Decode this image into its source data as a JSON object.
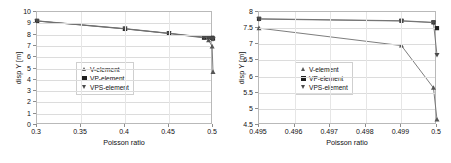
{
  "figure": {
    "panels": [
      {
        "id": "left",
        "chart_data": {
          "type": "line",
          "title": "",
          "xlabel": "Poisson ratio",
          "ylabel": "disp Y [m]",
          "xlim": [
            0.3,
            0.5
          ],
          "ylim": [
            0,
            10
          ],
          "xticks": [
            "0.3",
            "0.35",
            "0.4",
            "0.45",
            "0.5"
          ],
          "xtick_values": [
            0.3,
            0.35,
            0.4,
            0.45,
            0.5
          ],
          "yticks": [
            "0",
            "1",
            "2",
            "3",
            "4",
            "5",
            "6",
            "7",
            "8",
            "9",
            "10"
          ],
          "ytick_values": [
            0,
            1,
            2,
            3,
            4,
            5,
            6,
            7,
            8,
            9,
            10
          ],
          "grid": true,
          "legend_position": "center-left",
          "series": [
            {
              "name": "V-element",
              "marker": "triangle-up",
              "color": "#555555",
              "x": [
                0.3,
                0.4,
                0.45,
                0.49,
                0.495,
                0.499,
                0.5
              ],
              "values": [
                9.2,
                8.5,
                8.1,
                7.7,
                7.5,
                6.95,
                4.7
              ]
            },
            {
              "name": "VP-element",
              "marker": "square",
              "color": "#1f1f1f",
              "x": [
                0.3,
                0.4,
                0.45,
                0.49,
                0.495,
                0.499,
                0.5
              ],
              "values": [
                9.22,
                8.53,
                8.12,
                7.78,
                7.78,
                7.72,
                7.65
              ]
            },
            {
              "name": "VPS-element",
              "marker": "triangle-down",
              "color": "#4a4a4a",
              "x": [
                0.3,
                0.4,
                0.45,
                0.49,
                0.495,
                0.499,
                0.5
              ],
              "values": [
                9.2,
                8.51,
                8.1,
                7.75,
                7.7,
                7.68,
                7.6
              ]
            }
          ]
        }
      },
      {
        "id": "right",
        "chart_data": {
          "type": "line",
          "title": "",
          "xlabel": "Poisson ratio",
          "ylabel": "disp Y [m]",
          "xlim": [
            0.495,
            0.5
          ],
          "ylim": [
            4.5,
            8
          ],
          "xticks": [
            "0.495",
            "0.496",
            "0.497",
            "0.498",
            "0.499",
            "0.5"
          ],
          "xtick_values": [
            0.495,
            0.496,
            0.497,
            0.498,
            0.499,
            0.5
          ],
          "yticks": [
            "4.5",
            "5",
            "5.5",
            "6",
            "6.5",
            "7",
            "7.5",
            "8"
          ],
          "ytick_values": [
            4.5,
            5,
            5.5,
            6,
            6.5,
            7,
            7.5,
            8
          ],
          "grid": true,
          "legend_position": "center-left",
          "series": [
            {
              "name": "V-element",
              "marker": "triangle-up",
              "color": "#555555",
              "x": [
                0.495,
                0.499,
                0.4999,
                0.5
              ],
              "values": [
                7.5,
                6.96,
                5.65,
                4.67
              ]
            },
            {
              "name": "VP-element",
              "marker": "square",
              "color": "#1f1f1f",
              "x": [
                0.495,
                0.499,
                0.4999,
                0.5
              ],
              "values": [
                7.79,
                7.73,
                7.68,
                7.5
              ]
            },
            {
              "name": "VPS-element",
              "marker": "triangle-down",
              "color": "#4a4a4a",
              "x": [
                0.495,
                0.499,
                0.4999,
                0.5
              ],
              "values": [
                7.78,
                7.72,
                7.67,
                6.67
              ]
            }
          ]
        }
      }
    ]
  }
}
